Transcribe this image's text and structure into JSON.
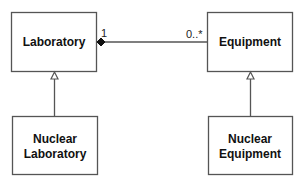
{
  "diagram": {
    "type": "UML class diagram",
    "classes": [
      {
        "id": "laboratory",
        "lines": [
          "Laboratory"
        ]
      },
      {
        "id": "equipment",
        "lines": [
          "Equipment"
        ]
      },
      {
        "id": "nuclear_laboratory",
        "lines": [
          "Nuclear",
          "Laboratory"
        ]
      },
      {
        "id": "nuclear_equipment",
        "lines": [
          "Nuclear",
          "Equipment"
        ]
      }
    ],
    "association": {
      "from": "Laboratory",
      "to": "Equipment",
      "kind": "composition",
      "from_multiplicity": "1",
      "to_multiplicity": "0..*"
    },
    "generalizations": [
      {
        "child": "Nuclear Laboratory",
        "parent": "Laboratory"
      },
      {
        "child": "Nuclear Equipment",
        "parent": "Equipment"
      }
    ],
    "colors": {
      "line": "#555555",
      "text": "#111111",
      "background": "#ffffff"
    }
  }
}
